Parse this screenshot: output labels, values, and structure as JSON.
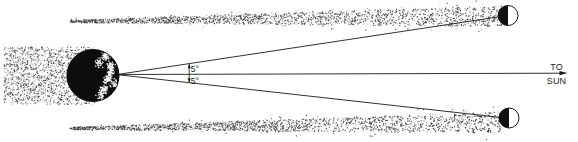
{
  "figure": {
    "kind": "astronomy-orbit-diagram",
    "background": "#ffffff",
    "colors": {
      "ink": "#1b1b1b",
      "dust": "#2e2e2e",
      "moon_lit": "#ffffff",
      "moon_dark": "#111111",
      "earth_fill": "#0d0d0d",
      "continent_speckle": "#ffffff"
    },
    "elements": [
      "dust-band-left",
      "earth-globe",
      "sightline-upper",
      "sun-direction-line",
      "sightline-lower",
      "angle-dimension",
      "dust-band-upper",
      "dust-band-lower",
      "moon-upper",
      "moon-lower"
    ]
  },
  "labels": {
    "angle_upper": "5°",
    "angle_lower": "5°",
    "to_sun_line1": "TO",
    "to_sun_line2": "SUN"
  }
}
